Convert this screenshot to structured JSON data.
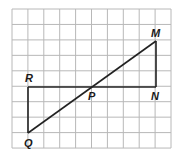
{
  "diagram": {
    "grid": {
      "cols": 10,
      "rows": 9,
      "left": 12,
      "top": 9,
      "cell_w": 15.9,
      "cell_h": 15.45,
      "color": "#b8b8b8"
    },
    "line_color": "#222222",
    "points": {
      "M": {
        "label": "M",
        "x": 156,
        "y": 41
      },
      "N": {
        "label": "N",
        "x": 156,
        "y": 87
      },
      "R": {
        "label": "R",
        "x": 28,
        "y": 87
      },
      "Q": {
        "label": "Q",
        "x": 28,
        "y": 133
      },
      "P": {
        "label": "P",
        "x": 91,
        "y": 87
      }
    },
    "segments": [
      [
        "M",
        "N"
      ],
      [
        "R",
        "N"
      ],
      [
        "R",
        "Q"
      ],
      [
        "Q",
        "M"
      ]
    ]
  }
}
